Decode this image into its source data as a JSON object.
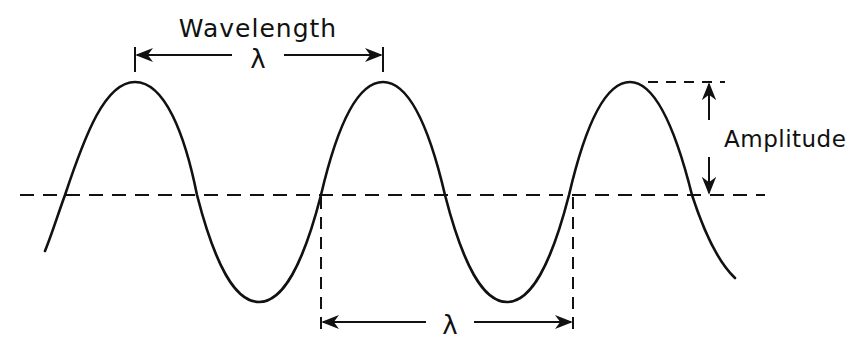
{
  "diagram": {
    "type": "wave-anatomy",
    "labels": {
      "wavelength_title": "Wavelength",
      "wavelength_symbol_top": "λ",
      "wavelength_symbol_bottom": "λ",
      "amplitude": "Amplitude"
    },
    "colors": {
      "line": "#111111",
      "background": "#ffffff"
    },
    "geometry": {
      "midline_y": 195,
      "crest_y": 82,
      "trough_y": 302,
      "crest_x": [
        135,
        383,
        630
      ],
      "trough_x": [
        259,
        507
      ],
      "period_px": 247.5,
      "amplitude_px": 113
    }
  }
}
